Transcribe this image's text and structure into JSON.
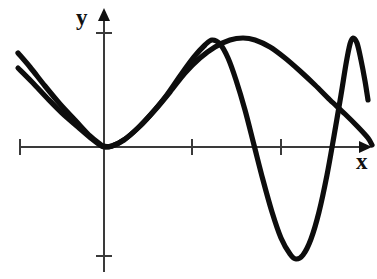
{
  "figure": {
    "title": "",
    "background_color": "#ffffff",
    "width": 377,
    "height": 279,
    "axis_color": "#3a3a3a",
    "curve_color": "#0d0d0d"
  },
  "labels": {
    "y_axis": "y",
    "x_axis": "x"
  },
  "chart_data": {
    "type": "line",
    "title": "",
    "xlabel": "x",
    "ylabel": "y",
    "grid": false,
    "legend": "none",
    "axes": {
      "origin_px": [
        104,
        147
      ],
      "x_axis_y_px": 147,
      "y_axis_x_px": 104,
      "x_axis_range_px": [
        20,
        372
      ],
      "y_axis_range_px": [
        8,
        272
      ],
      "x_ticks_px": [
        20,
        192,
        281
      ],
      "y_ticks_px": [
        33,
        256
      ],
      "x_arrow": "right",
      "y_arrow": "up"
    },
    "series": [
      {
        "name": "smooth-curve",
        "description": "Smooth wide wave: starts upper-left, descends tangent to x-axis at origin, rises to a broad maximum right of center, then descends gradually to the right edge at the x-axis arrow.",
        "points": [
          [
            18,
            53
          ],
          [
            30,
            67
          ],
          [
            45,
            86
          ],
          [
            60,
            104
          ],
          [
            75,
            120
          ],
          [
            90,
            136
          ],
          [
            100,
            144
          ],
          [
            104,
            146
          ],
          [
            112,
            146
          ],
          [
            125,
            139
          ],
          [
            140,
            126
          ],
          [
            155,
            110
          ],
          [
            170,
            92
          ],
          [
            185,
            73
          ],
          [
            200,
            58
          ],
          [
            215,
            47
          ],
          [
            230,
            40
          ],
          [
            243,
            38
          ],
          [
            255,
            40
          ],
          [
            270,
            47
          ],
          [
            285,
            58
          ],
          [
            300,
            71
          ],
          [
            315,
            85
          ],
          [
            330,
            100
          ],
          [
            345,
            114
          ],
          [
            358,
            127
          ],
          [
            368,
            138
          ],
          [
            372,
            145
          ]
        ]
      },
      {
        "name": "oscillating-curve",
        "description": "Faster oscillating wave of growing amplitude: starts upper-left just below the smooth curve, touches x-axis at origin, peaks left of the smooth curve's peak, plunges to a deep minimum below the axis, then rises to a tall narrow peak near the right edge and falls again.",
        "points": [
          [
            18,
            68
          ],
          [
            32,
            82
          ],
          [
            48,
            99
          ],
          [
            62,
            113
          ],
          [
            78,
            127
          ],
          [
            92,
            139
          ],
          [
            100,
            145
          ],
          [
            104,
            147
          ],
          [
            112,
            146
          ],
          [
            124,
            140
          ],
          [
            138,
            128
          ],
          [
            152,
            113
          ],
          [
            166,
            96
          ],
          [
            180,
            76
          ],
          [
            194,
            57
          ],
          [
            205,
            45
          ],
          [
            212,
            40
          ],
          [
            220,
            44
          ],
          [
            228,
            58
          ],
          [
            236,
            80
          ],
          [
            245,
            110
          ],
          [
            254,
            145
          ],
          [
            263,
            180
          ],
          [
            272,
            212
          ],
          [
            281,
            238
          ],
          [
            290,
            254
          ],
          [
            296,
            259
          ],
          [
            303,
            255
          ],
          [
            311,
            239
          ],
          [
            319,
            212
          ],
          [
            327,
            175
          ],
          [
            334,
            136
          ],
          [
            341,
            95
          ],
          [
            346,
            64
          ],
          [
            350,
            44
          ],
          [
            353,
            38
          ],
          [
            357,
            43
          ],
          [
            361,
            60
          ],
          [
            365,
            81
          ],
          [
            368,
            100
          ]
        ]
      }
    ]
  }
}
